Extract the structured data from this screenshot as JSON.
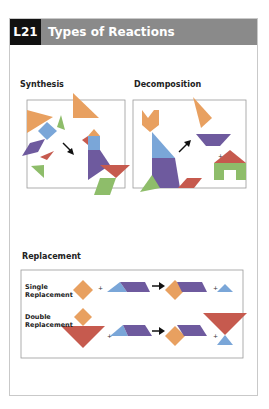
{
  "header": {
    "lesson_code": "L21",
    "title": "Types of Reactions"
  },
  "sections": {
    "synthesis": {
      "label": "Synthesis"
    },
    "decomposition": {
      "label": "Decomposition"
    },
    "replacement": {
      "label": "Replacement",
      "rows": [
        {
          "label_line1": "Single",
          "label_line2": "Replacement"
        },
        {
          "label_line1": "Double",
          "label_line2": "Replacement"
        }
      ]
    }
  },
  "symbols": {
    "plus": "+"
  },
  "colors": {
    "header_bg": "#8a8a8a",
    "lesson_bg": "#111111",
    "orange": "#e8a060",
    "blue": "#7aa6d8",
    "purple": "#6e5a9e",
    "green": "#8ebd6a",
    "red": "#c65a4e",
    "gray_piece": "#9a9a9a"
  }
}
